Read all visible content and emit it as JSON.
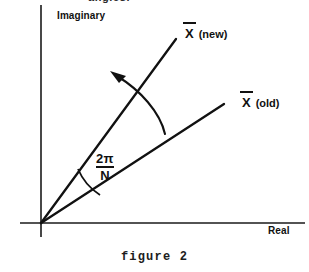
{
  "figure": {
    "caption": "figure 2",
    "cut_off_text_top": "angles.",
    "axes": {
      "vertical_label": "Imaginary",
      "horizontal_label": "Real",
      "origin": [
        41,
        223
      ],
      "vertical_top": [
        41,
        5
      ],
      "horizontal_right": [
        305,
        223
      ]
    },
    "vectors": [
      {
        "name": "x-new",
        "symbol": "X",
        "overbar": true,
        "suffix": "(new)",
        "label": "X̄ (new)",
        "angle_deg": 58,
        "tip": [
          175,
          40
        ]
      },
      {
        "name": "x-old",
        "symbol": "X",
        "overbar": true,
        "suffix": "(old)",
        "label": "X̄ (old)",
        "angle_deg": 33,
        "tip": [
          222,
          105
        ]
      }
    ],
    "angle_annotation": {
      "numerator": "2π",
      "denominator": "N",
      "label": "2π/N"
    },
    "rotation_arrow": {
      "name": "rotation-arrow",
      "direction": "counter-clockwise",
      "arrowhead_at": [
        113,
        72
      ]
    },
    "colors": {
      "ink": "#111111",
      "background": "#ffffff"
    }
  }
}
